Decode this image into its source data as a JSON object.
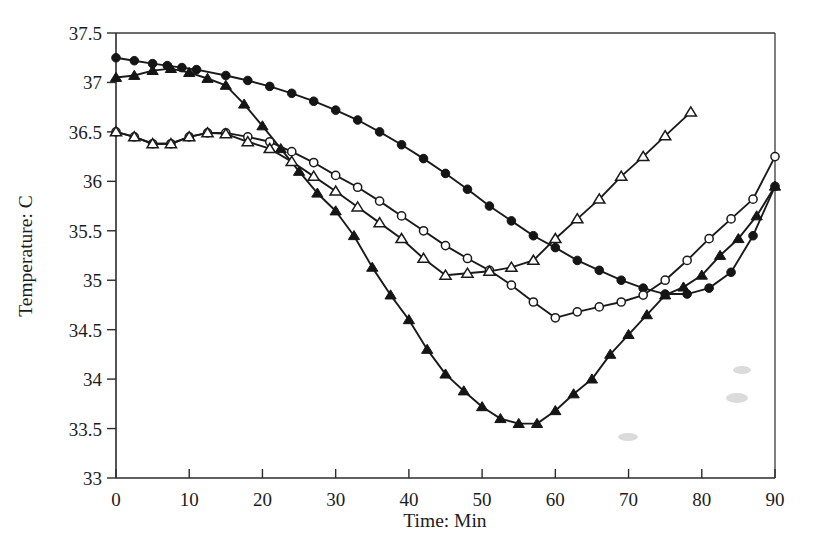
{
  "figure": {
    "background_color": "#ffffff",
    "ink_color": "#1a1a1a"
  },
  "axes": {
    "x_title": "Time: Min",
    "y_title": "Temperature: C",
    "x_ticks": [
      "0",
      "10",
      "20",
      "30",
      "40",
      "50",
      "60",
      "70",
      "80",
      "90"
    ],
    "y_ticks": [
      "33",
      "33.5",
      "34",
      "34.5",
      "35",
      "35.5",
      "36",
      "36.5",
      "37",
      "37.5"
    ]
  },
  "chart_data": {
    "type": "line",
    "title": "",
    "xlabel": "Time: Min",
    "ylabel": "Temperature: C",
    "xlim": [
      0,
      90
    ],
    "ylim": [
      33,
      37.5
    ],
    "xticks": [
      0,
      10,
      20,
      30,
      40,
      50,
      60,
      70,
      80,
      90
    ],
    "yticks": [
      33,
      33.5,
      34,
      34.5,
      35,
      35.5,
      36,
      36.5,
      37,
      37.5
    ],
    "grid": false,
    "legend": "none",
    "series": [
      {
        "name": "Series 1",
        "marker": "filled-circle",
        "x": [
          0,
          2.5,
          5,
          7,
          9,
          11,
          15,
          18,
          21,
          24,
          27,
          30,
          33,
          36,
          39,
          42,
          45,
          48,
          51,
          54,
          57,
          60,
          63,
          66,
          69,
          72,
          75,
          78,
          81,
          84,
          87,
          90
        ],
        "y": [
          37.25,
          37.22,
          37.19,
          37.17,
          37.15,
          37.13,
          37.07,
          37.02,
          36.96,
          36.89,
          36.81,
          36.72,
          36.62,
          36.5,
          36.37,
          36.23,
          36.08,
          35.92,
          35.75,
          35.6,
          35.45,
          35.33,
          35.2,
          35.1,
          35.0,
          34.92,
          34.86,
          34.86,
          34.92,
          35.08,
          35.45,
          35.95
        ]
      },
      {
        "name": "Series 2",
        "marker": "filled-triangle",
        "x": [
          0,
          2.5,
          5,
          7.5,
          10,
          12.5,
          15,
          17.5,
          20,
          22.5,
          25,
          27.5,
          30,
          32.5,
          35,
          37.5,
          40,
          42.5,
          45,
          47.5,
          50,
          52.5,
          55,
          57.5,
          60,
          62.5,
          65,
          67.5,
          70,
          72.5,
          75,
          77.5,
          80,
          82.5,
          85,
          87.5,
          90
        ],
        "y": [
          37.05,
          37.07,
          37.12,
          37.14,
          37.1,
          37.04,
          36.97,
          36.78,
          36.56,
          36.33,
          36.1,
          35.88,
          35.7,
          35.45,
          35.13,
          34.85,
          34.6,
          34.3,
          34.05,
          33.88,
          33.72,
          33.6,
          33.55,
          33.55,
          33.68,
          33.85,
          34.0,
          34.25,
          34.45,
          34.65,
          34.85,
          34.93,
          35.05,
          35.25,
          35.42,
          35.65,
          35.95
        ]
      },
      {
        "name": "Series 3",
        "marker": "open-circle",
        "x": [
          0,
          2.5,
          5,
          7.5,
          10,
          12.5,
          15,
          18,
          21,
          24,
          27,
          30,
          33,
          36,
          39,
          42,
          45,
          48,
          51,
          54,
          57,
          60,
          63,
          66,
          69,
          72,
          75,
          78,
          81,
          84,
          87,
          90
        ],
        "y": [
          36.5,
          36.45,
          36.38,
          36.38,
          36.45,
          36.49,
          36.49,
          36.45,
          36.4,
          36.3,
          36.19,
          36.06,
          35.94,
          35.8,
          35.65,
          35.5,
          35.35,
          35.22,
          35.1,
          34.95,
          34.78,
          34.62,
          34.68,
          34.73,
          34.78,
          34.85,
          35.0,
          35.2,
          35.42,
          35.62,
          35.82,
          36.25
        ]
      },
      {
        "name": "Series 4",
        "marker": "open-triangle",
        "x": [
          0,
          2.5,
          5,
          7.5,
          10,
          12.5,
          15,
          18,
          21,
          24,
          27,
          30,
          33,
          36,
          39,
          42,
          45,
          48,
          51,
          54,
          57,
          60,
          63,
          66,
          69,
          72,
          75,
          78.5
        ],
        "y": [
          36.5,
          36.45,
          36.38,
          36.38,
          36.45,
          36.49,
          36.48,
          36.4,
          36.33,
          36.2,
          36.05,
          35.9,
          35.74,
          35.58,
          35.42,
          35.22,
          35.05,
          35.07,
          35.09,
          35.13,
          35.2,
          35.42,
          35.62,
          35.82,
          36.05,
          36.25,
          36.46,
          36.7
        ]
      }
    ]
  }
}
